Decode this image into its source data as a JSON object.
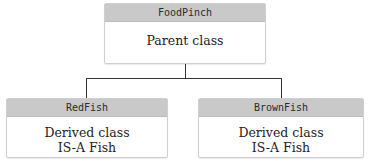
{
  "diagram": {
    "type": "class-inheritance",
    "parent": {
      "name": "FoodPinch",
      "description": "Parent class"
    },
    "children": [
      {
        "name": "RedFish",
        "description_line1": "Derived class",
        "description_line2": "IS-A Fish"
      },
      {
        "name": "BrownFish",
        "description_line1": "Derived class",
        "description_line2": "IS-A Fish"
      }
    ],
    "colors": {
      "header_bg": "#c9c9c9",
      "border": "#cfcfcf",
      "connector": "#333333"
    }
  }
}
